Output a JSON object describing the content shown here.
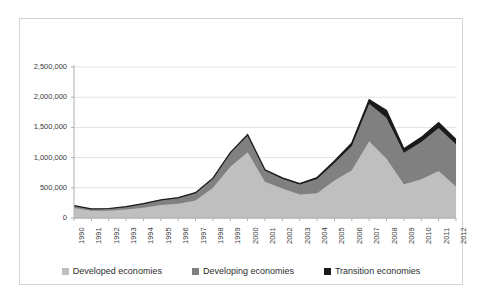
{
  "chart_data": {
    "type": "area",
    "stacked": true,
    "title": "",
    "subtitle": "",
    "xlabel": "",
    "ylabel": "",
    "categories": [
      "1990",
      "1991",
      "1992",
      "1993",
      "1994",
      "1995",
      "1996",
      "1997",
      "1998",
      "1999",
      "2000",
      "2001",
      "2002",
      "2003",
      "2004",
      "2005",
      "2006",
      "2007",
      "2008",
      "2009",
      "2010",
      "2011",
      "2012"
    ],
    "ylim": [
      0,
      2500000
    ],
    "ytick_labels": [
      "0",
      "500,000",
      "1,000,000",
      "1,500,000",
      "2,000,000",
      "2,500,000"
    ],
    "ytick_values": [
      0,
      500000,
      1000000,
      1500000,
      2000000,
      2500000
    ],
    "grid": true,
    "legend_position": "bottom",
    "series": [
      {
        "name": "Developed economies",
        "color": "#bfbfbf",
        "values": [
          165000,
          120000,
          120000,
          140000,
          170000,
          215000,
          235000,
          290000,
          500000,
          850000,
          1090000,
          600000,
          490000,
          390000,
          410000,
          620000,
          790000,
          1270000,
          980000,
          560000,
          640000,
          780000,
          520000
        ]
      },
      {
        "name": "Developing economies",
        "color": "#808080",
        "values": [
          40000,
          30000,
          35000,
          45000,
          65000,
          80000,
          95000,
          120000,
          150000,
          220000,
          275000,
          185000,
          160000,
          165000,
          235000,
          290000,
          400000,
          620000,
          680000,
          520000,
          620000,
          710000,
          700000
        ]
      },
      {
        "name": "Transition economies",
        "color": "#1a1a1a",
        "values": [
          1000,
          1000,
          2000,
          3000,
          4000,
          5000,
          7000,
          9000,
          10000,
          12000,
          15000,
          12000,
          14000,
          15000,
          25000,
          35000,
          55000,
          70000,
          120000,
          65000,
          75000,
          90000,
          80000
        ]
      }
    ],
    "series_totals": [
      206000,
      151000,
      157000,
      188000,
      239000,
      300000,
      337000,
      419000,
      660000,
      1082000,
      1380000,
      797000,
      664000,
      570000,
      670000,
      945000,
      1245000,
      1960000,
      1780000,
      1145000,
      1335000,
      1580000,
      1300000
    ]
  },
  "legend": {
    "items": [
      {
        "label": "Developed economies",
        "color": "#bfbfbf"
      },
      {
        "label": "Developing economies",
        "color": "#808080"
      },
      {
        "label": "Transition economies",
        "color": "#1a1a1a"
      }
    ]
  },
  "colors": {
    "frame_border": "#d4d4d4",
    "gridline": "#e2e2e2",
    "axis": "#b0b0b0",
    "text": "#3a3a3a",
    "background": "#ffffff"
  }
}
